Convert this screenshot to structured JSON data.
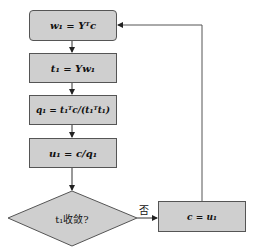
{
  "diagram": {
    "type": "flowchart",
    "nodes": [
      {
        "id": "step1",
        "shape": "rounded-rect",
        "label": "w₁ = Yᵀc"
      },
      {
        "id": "step2",
        "shape": "rect",
        "label": "t₁ = Yw₁"
      },
      {
        "id": "step3",
        "shape": "rect",
        "label": "q₁ = t₁ᵀc/(t₁ᵀt₁)"
      },
      {
        "id": "step4",
        "shape": "rect",
        "label": "u₁ = c/q₁"
      },
      {
        "id": "decision",
        "shape": "diamond",
        "label": "t₁收敛?"
      },
      {
        "id": "step5",
        "shape": "rect",
        "label": "c = u₁"
      }
    ],
    "edges": [
      {
        "from": "step1",
        "to": "step2"
      },
      {
        "from": "step2",
        "to": "step3"
      },
      {
        "from": "step3",
        "to": "step4"
      },
      {
        "from": "step4",
        "to": "decision"
      },
      {
        "from": "decision",
        "to": "step5",
        "label": "否"
      },
      {
        "from": "step5",
        "to": "step1"
      }
    ],
    "no_label": "否",
    "colors": {
      "node_fill": "#cfcfcf",
      "node_border": "#555555",
      "edge": "#333333"
    }
  }
}
